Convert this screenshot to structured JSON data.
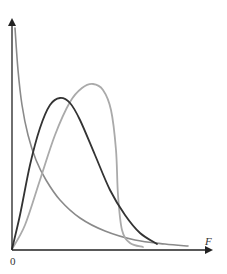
{
  "chart_data": {
    "type": "line",
    "title": "",
    "xlabel": "F",
    "ylabel": "",
    "x_tick_labels": [
      "0"
    ],
    "grid": false,
    "legend": null,
    "series": [
      {
        "name": "decreasing-curve",
        "color": "#8a8a8a",
        "shape": "monotonically decreasing from high value near F=0, long right tail",
        "points_px": [
          [
            15,
            28
          ],
          [
            18,
            70
          ],
          [
            22,
            105
          ],
          [
            28,
            135
          ],
          [
            36,
            160
          ],
          [
            46,
            180
          ],
          [
            60,
            200
          ],
          [
            80,
            218
          ],
          [
            105,
            231
          ],
          [
            135,
            240
          ],
          [
            165,
            244
          ],
          [
            188,
            246
          ]
        ]
      },
      {
        "name": "dark-skewed-curve",
        "color": "#333333",
        "shape": "starts at 0, peaks early, right-skewed",
        "peak_px": [
          60,
          98
        ],
        "points_px": [
          [
            12,
            249
          ],
          [
            20,
            215
          ],
          [
            30,
            165
          ],
          [
            40,
            128
          ],
          [
            50,
            105
          ],
          [
            60,
            98
          ],
          [
            70,
            103
          ],
          [
            80,
            120
          ],
          [
            95,
            155
          ],
          [
            110,
            190
          ],
          [
            125,
            215
          ],
          [
            140,
            233
          ],
          [
            157,
            244
          ]
        ]
      },
      {
        "name": "light-peaked-curve",
        "color": "#aaaaaa",
        "shape": "starts at 0, peaks later and higher, drops sharply",
        "peak_px": [
          93,
          84
        ],
        "points_px": [
          [
            12,
            249
          ],
          [
            25,
            225
          ],
          [
            40,
            180
          ],
          [
            55,
            135
          ],
          [
            70,
            102
          ],
          [
            82,
            88
          ],
          [
            93,
            84
          ],
          [
            103,
            90
          ],
          [
            111,
            110
          ],
          [
            116,
            150
          ],
          [
            118,
            195
          ],
          [
            122,
            230
          ],
          [
            130,
            243
          ],
          [
            143,
            247
          ]
        ]
      }
    ]
  },
  "axes": {
    "origin_label": "0",
    "x_axis_label": "F",
    "axis_color": "#222222"
  }
}
